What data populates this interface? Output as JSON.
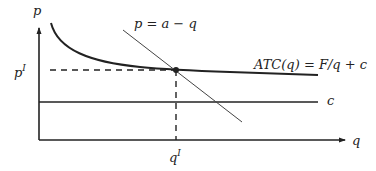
{
  "diagram": {
    "axes": {
      "y_label": "p",
      "x_label": "q"
    },
    "curves": {
      "demand": {
        "label": "p = a − q"
      },
      "atc": {
        "label": "ATC(q) = F/q + c"
      },
      "marginal_cost": {
        "label": "c"
      }
    },
    "equilibrium": {
      "price_label": "p",
      "price_sup": "I",
      "quantity_label": "q",
      "quantity_sup": "I"
    }
  },
  "colors": {
    "line": "#222222",
    "thin_line": "#444444",
    "background": "#ffffff"
  }
}
